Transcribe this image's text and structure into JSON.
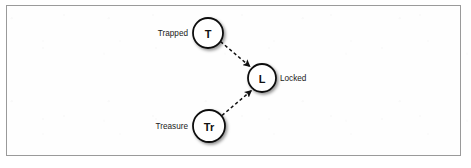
{
  "figure": {
    "frame": {
      "border_color": "#9a9a9a",
      "background_color": "#fefefe"
    }
  },
  "diagram": {
    "type": "state-diagram",
    "node_fill_color": "#ffffff",
    "node_stroke_color": "#111111",
    "edge_color": "#111111",
    "edge_style": "dashed",
    "nodes": [
      {
        "id": "trapped",
        "letter": "T",
        "caption": "Trapped",
        "caption_side": "left",
        "cx": 208,
        "cy": 33,
        "r": 15
      },
      {
        "id": "locked",
        "letter": "L",
        "caption": "Locked",
        "caption_side": "right",
        "cx": 262,
        "cy": 78,
        "r": 14
      },
      {
        "id": "treasure",
        "letter": "Tr",
        "caption": "Treasure",
        "caption_side": "left",
        "cx": 209,
        "cy": 126,
        "r": 16
      }
    ],
    "edges": [
      {
        "id": "trapped-to-locked",
        "from": "trapped",
        "to": "locked",
        "label": "",
        "arrowhead": "filled-triangle"
      },
      {
        "id": "treasure-to-locked",
        "from": "treasure",
        "to": "locked",
        "label": "",
        "arrowhead": "filled-triangle"
      }
    ]
  }
}
